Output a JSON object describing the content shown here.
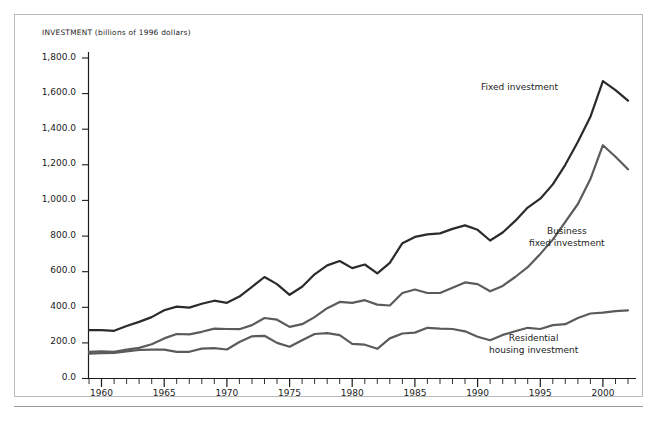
{
  "chart_data": {
    "type": "line",
    "title": "INVESTMENT (billions of 1996 dollars)",
    "xlabel": "",
    "ylabel": "INVESTMENT (billions of 1996 dollars)",
    "xlim": [
      1959,
      2002
    ],
    "ylim": [
      0.0,
      1800.0
    ],
    "grid": false,
    "legend_position": "inline-annotations",
    "y_ticks": [
      "0.0",
      "200.0",
      "400.0",
      "600.0",
      "800.0",
      "1,000.0",
      "1,200.0",
      "1,400.0",
      "1,600.0",
      "1,800.0"
    ],
    "y_tick_values": [
      0,
      200,
      400,
      600,
      800,
      1000,
      1200,
      1400,
      1600,
      1800
    ],
    "x_ticks": [
      "1960",
      "1965",
      "1970",
      "1975",
      "1980",
      "1985",
      "1990",
      "1995",
      "2000"
    ],
    "x_tick_values": [
      1960,
      1965,
      1970,
      1975,
      1980,
      1985,
      1990,
      1995,
      2000
    ],
    "x_minor_tick_interval": 1,
    "x": [
      1959,
      1960,
      1961,
      1962,
      1963,
      1964,
      1965,
      1966,
      1967,
      1968,
      1969,
      1970,
      1971,
      1972,
      1973,
      1974,
      1975,
      1976,
      1977,
      1978,
      1979,
      1980,
      1981,
      1982,
      1983,
      1984,
      1985,
      1986,
      1987,
      1988,
      1989,
      1990,
      1991,
      1992,
      1993,
      1994,
      1995,
      1996,
      1997,
      1998,
      1999,
      2000,
      2001,
      2002
    ],
    "series": [
      {
        "name": "Fixed investment",
        "color": "#2b2b2b",
        "values": [
          272,
          272,
          268,
          295,
          318,
          345,
          383,
          404,
          398,
          420,
          437,
          425,
          460,
          515,
          570,
          530,
          470,
          515,
          585,
          635,
          660,
          620,
          640,
          590,
          650,
          760,
          795,
          810,
          815,
          840,
          860,
          835,
          775,
          820,
          885,
          960,
          1010,
          1090,
          1200,
          1330,
          1470,
          1670,
          1620,
          1560
        ]
      },
      {
        "name": "Business fixed investment",
        "color": "#5b5b5b",
        "values": [
          150,
          152,
          150,
          162,
          172,
          192,
          225,
          250,
          248,
          262,
          280,
          278,
          277,
          300,
          340,
          330,
          290,
          305,
          345,
          395,
          430,
          425,
          440,
          415,
          410,
          480,
          500,
          480,
          480,
          510,
          540,
          530,
          490,
          520,
          570,
          625,
          700,
          780,
          880,
          980,
          1120,
          1310,
          1245,
          1175
        ]
      },
      {
        "name": "Residential housing investment",
        "color": "#5b5b5b",
        "values": [
          140,
          142,
          143,
          152,
          160,
          162,
          162,
          150,
          150,
          168,
          170,
          163,
          205,
          237,
          240,
          200,
          178,
          215,
          250,
          255,
          243,
          195,
          190,
          167,
          225,
          253,
          258,
          285,
          280,
          278,
          265,
          235,
          215,
          245,
          265,
          285,
          278,
          300,
          305,
          340,
          365,
          370,
          378,
          383
        ]
      }
    ],
    "annotations": [
      {
        "text": "Fixed investment",
        "lines": [
          "Fixed investment"
        ]
      },
      {
        "text": "Business fixed investment",
        "lines": [
          "Business",
          "fixed investment"
        ]
      },
      {
        "text": "Residential housing investment",
        "lines": [
          "Residential",
          "housing investment"
        ]
      }
    ]
  },
  "figure": {
    "background_color": "#ffffff",
    "frame_color": "#b9b9b9",
    "axis_color": "#1c1c1c"
  }
}
